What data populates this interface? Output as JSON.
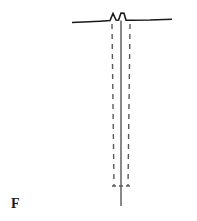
{
  "figure": {
    "label": "F",
    "label_position": "bottom-left",
    "background_color": "#ffffff",
    "stroke_color": "#1a1a1a",
    "dashed_stroke_color": "#5a5a5a",
    "width": 197,
    "height": 221
  },
  "chart_data": {
    "type": "line",
    "title": "",
    "subtitle": "",
    "xlabel": "",
    "ylabel": "",
    "grid": false,
    "legend": false,
    "annotations": [
      {
        "name": "figure-label",
        "text": "F",
        "x": 11,
        "y": 204
      }
    ],
    "series": [
      {
        "name": "ground-surface-line",
        "style": "solid",
        "color": "#1a1a1a",
        "width": 1.6,
        "points": [
          [
            72,
            22.5
          ],
          [
            100,
            21.2
          ],
          [
            110,
            20.6
          ],
          [
            113,
            13.5
          ],
          [
            116,
            20.0
          ],
          [
            118.5,
            20.2
          ],
          [
            121,
            13.0
          ],
          [
            124,
            13.2
          ],
          [
            126,
            20.3
          ],
          [
            131,
            20.2
          ],
          [
            150,
            20.0
          ],
          [
            172,
            19.2
          ]
        ]
      },
      {
        "name": "center-solid-vertical-line",
        "style": "solid",
        "color": "#3a3a3a",
        "width": 1.2,
        "points": [
          [
            121,
            20.5
          ],
          [
            121,
            206
          ]
        ]
      },
      {
        "name": "left-dashed-vertical-line",
        "style": "dashed",
        "color": "#5a5a5a",
        "width": 1.4,
        "dash": [
          5,
          5
        ],
        "points": [
          [
            112,
            24
          ],
          [
            114,
            186
          ]
        ]
      },
      {
        "name": "right-dashed-vertical-line",
        "style": "dashed",
        "color": "#5a5a5a",
        "width": 1.4,
        "dash": [
          5,
          5
        ],
        "points": [
          [
            130,
            24
          ],
          [
            128,
            186
          ]
        ]
      },
      {
        "name": "bottom-dashed-connector",
        "style": "dashed",
        "color": "#5a5a5a",
        "width": 1.4,
        "dash": [
          4,
          3
        ],
        "points": [
          [
            112,
            186
          ],
          [
            130,
            186
          ]
        ]
      }
    ],
    "xlim": [
      0,
      197
    ],
    "ylim": [
      221,
      0
    ]
  }
}
